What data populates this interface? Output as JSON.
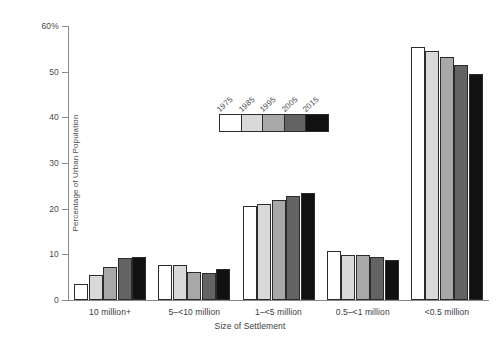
{
  "chart_data": {
    "type": "bar",
    "title": "",
    "xlabel": "Size of Settlement",
    "ylabel": "Percentage of Urban Population",
    "categories": [
      "10 million+",
      "5–<10 million",
      "1–<5 million",
      "0.5–<1 million",
      "<0.5 million"
    ],
    "series": [
      {
        "name": "1975",
        "color": "#ffffff",
        "values": [
          3.5,
          7.7,
          20.5,
          10.8,
          55.5
        ]
      },
      {
        "name": "1985",
        "color": "#d9d9d9",
        "values": [
          5.4,
          7.7,
          21.1,
          9.9,
          54.5
        ]
      },
      {
        "name": "1995",
        "color": "#a8a8a8",
        "values": [
          7.2,
          6.1,
          22.0,
          9.8,
          53.3
        ]
      },
      {
        "name": "2005",
        "color": "#636363",
        "values": [
          9.2,
          6.0,
          22.7,
          9.5,
          51.4
        ]
      },
      {
        "name": "2015",
        "color": "#111111",
        "values": [
          9.4,
          6.8,
          23.4,
          8.8,
          49.5
        ]
      }
    ],
    "ylim": [
      0,
      60
    ],
    "yticks": [
      {
        "value": 0,
        "label": "0"
      },
      {
        "value": 10,
        "label": "10"
      },
      {
        "value": 20,
        "label": "20"
      },
      {
        "value": 30,
        "label": "30"
      },
      {
        "value": 40,
        "label": "40"
      },
      {
        "value": 50,
        "label": "50"
      },
      {
        "value": 60,
        "label": "60%"
      }
    ],
    "grid": false,
    "legend_position": "upper-center",
    "bar_outline_color": "#2b2b2b",
    "axis_color": "#8a8a8a",
    "background": "#ffffff"
  }
}
